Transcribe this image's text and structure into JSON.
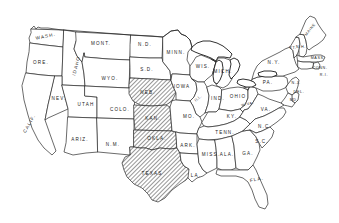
{
  "figure": {
    "type": "choropleth-outline-map",
    "title": "",
    "region": "Contiguous United States",
    "background_color": "#ffffff",
    "outline_color": "#2b2b2b",
    "shading": {
      "style": "diagonal-hatch",
      "color": "#4a4a4a",
      "description": "Diagonally hatched area covering the Southern Great Plains"
    }
  },
  "shaded_states": [
    "TEXAS",
    "OKLA.",
    "KAN.",
    "NEB."
  ],
  "states": [
    {
      "id": "wash",
      "label": "WASH.",
      "x": 46,
      "y": 37,
      "rot": "rot-slight",
      "size": "normal",
      "shaded": false
    },
    {
      "id": "ore",
      "label": "ORE.",
      "x": 41,
      "y": 63,
      "rot": "",
      "size": "normal",
      "shaded": false
    },
    {
      "id": "calif",
      "label": "CALIF.",
      "x": 30,
      "y": 124,
      "rot": "rot-calif",
      "size": "normal",
      "shaded": false
    },
    {
      "id": "idaho",
      "label": "IDAHO",
      "x": 77,
      "y": 66,
      "rot": "rot-idaho",
      "size": "normal",
      "shaded": false
    },
    {
      "id": "nev",
      "label": "NEV.",
      "x": 59,
      "y": 99,
      "rot": "",
      "size": "normal",
      "shaded": false
    },
    {
      "id": "utah",
      "label": "UTAH",
      "x": 86,
      "y": 105,
      "rot": "",
      "size": "normal",
      "shaded": false
    },
    {
      "id": "ariz",
      "label": "ARIZ.",
      "x": 80,
      "y": 140,
      "rot": "",
      "size": "normal",
      "shaded": false
    },
    {
      "id": "mont",
      "label": "MONT.",
      "x": 101,
      "y": 44,
      "rot": "",
      "size": "normal",
      "shaded": false
    },
    {
      "id": "wyo",
      "label": "WYO.",
      "x": 110,
      "y": 79,
      "rot": "",
      "size": "normal",
      "shaded": false
    },
    {
      "id": "colo",
      "label": "COLO.",
      "x": 120,
      "y": 110,
      "rot": "",
      "size": "normal",
      "shaded": false
    },
    {
      "id": "nm",
      "label": "N.M.",
      "x": 113,
      "y": 145,
      "rot": "",
      "size": "normal",
      "shaded": false
    },
    {
      "id": "nd",
      "label": "N.D.",
      "x": 145,
      "y": 45,
      "rot": "",
      "size": "normal",
      "shaded": false
    },
    {
      "id": "sd",
      "label": "S.D.",
      "x": 147,
      "y": 70,
      "rot": "",
      "size": "normal",
      "shaded": false
    },
    {
      "id": "neb",
      "label": "NEB.",
      "x": 148,
      "y": 93,
      "rot": "",
      "size": "normal",
      "shaded": true
    },
    {
      "id": "kan",
      "label": "KAN.",
      "x": 153,
      "y": 119,
      "rot": "",
      "size": "normal",
      "shaded": true
    },
    {
      "id": "okla",
      "label": "OKLA.",
      "x": 157,
      "y": 139,
      "rot": "",
      "size": "normal",
      "shaded": true
    },
    {
      "id": "texas",
      "label": "TEXAS",
      "x": 152,
      "y": 174,
      "rot": "",
      "size": "normal",
      "shaded": true
    },
    {
      "id": "minn",
      "label": "MINN.",
      "x": 176,
      "y": 53,
      "rot": "",
      "size": "normal",
      "shaded": false
    },
    {
      "id": "iowa",
      "label": "IOWA",
      "x": 182,
      "y": 87,
      "rot": "",
      "size": "normal",
      "shaded": false
    },
    {
      "id": "mo",
      "label": "MO.",
      "x": 189,
      "y": 117,
      "rot": "",
      "size": "normal",
      "shaded": false
    },
    {
      "id": "ark",
      "label": "ARK.",
      "x": 188,
      "y": 146,
      "rot": "",
      "size": "normal",
      "shaded": false
    },
    {
      "id": "la",
      "label": "LA.",
      "x": 196,
      "y": 176,
      "rot": "",
      "size": "normal",
      "shaded": false
    },
    {
      "id": "wis",
      "label": "WIS.",
      "x": 203,
      "y": 67,
      "rot": "",
      "size": "normal",
      "shaded": false
    },
    {
      "id": "ill",
      "label": "ILL.",
      "x": 199,
      "y": 99,
      "rot": "rot",
      "size": "tiny",
      "shaded": false
    },
    {
      "id": "mich",
      "label": "MICH.",
      "x": 223,
      "y": 72,
      "rot": "",
      "size": "normal",
      "shaded": false
    },
    {
      "id": "ind",
      "label": "IND.",
      "x": 218,
      "y": 99,
      "rot": "",
      "size": "normal",
      "shaded": false
    },
    {
      "id": "ohio",
      "label": "OHIO",
      "x": 238,
      "y": 97,
      "rot": "",
      "size": "normal",
      "shaded": false
    },
    {
      "id": "ky",
      "label": "KY.",
      "x": 232,
      "y": 117,
      "rot": "",
      "size": "normal",
      "shaded": false
    },
    {
      "id": "tenn",
      "label": "TENN.",
      "x": 225,
      "y": 133,
      "rot": "",
      "size": "normal",
      "shaded": false
    },
    {
      "id": "miss",
      "label": "MISS.",
      "x": 211,
      "y": 155,
      "rot": "",
      "size": "normal",
      "shaded": false
    },
    {
      "id": "ala",
      "label": "ALA.",
      "x": 227,
      "y": 155,
      "rot": "",
      "size": "normal",
      "shaded": false
    },
    {
      "id": "ga",
      "label": "GA.",
      "x": 248,
      "y": 154,
      "rot": "",
      "size": "normal",
      "shaded": false
    },
    {
      "id": "fla",
      "label": "FLA.",
      "x": 257,
      "y": 180,
      "rot": "rot-slight",
      "size": "normal",
      "shaded": false
    },
    {
      "id": "sc",
      "label": "S.C.",
      "x": 262,
      "y": 142,
      "rot": "",
      "size": "normal",
      "shaded": false
    },
    {
      "id": "nc",
      "label": "N.C.",
      "x": 265,
      "y": 127,
      "rot": "",
      "size": "normal",
      "shaded": false
    },
    {
      "id": "va",
      "label": "VA.",
      "x": 266,
      "y": 110,
      "rot": "",
      "size": "normal",
      "shaded": false
    },
    {
      "id": "wva",
      "label": "W.VA.",
      "x": 248,
      "y": 105,
      "rot": "rot-slight",
      "size": "tiny",
      "shaded": false
    },
    {
      "id": "pa",
      "label": "PA.",
      "x": 268,
      "y": 83,
      "rot": "",
      "size": "normal",
      "shaded": false
    },
    {
      "id": "ny",
      "label": "N.Y.",
      "x": 274,
      "y": 63,
      "rot": "",
      "size": "normal",
      "shaded": false
    },
    {
      "id": "vt",
      "label": "VT.",
      "x": 293,
      "y": 49,
      "rot": "",
      "size": "tiny",
      "shaded": false
    },
    {
      "id": "nh",
      "label": "N.H.",
      "x": 301,
      "y": 48,
      "rot": "",
      "size": "tiny",
      "shaded": false
    },
    {
      "id": "maine",
      "label": "MAINE",
      "x": 311,
      "y": 30,
      "rot": "rot-maine",
      "size": "tiny",
      "shaded": false
    },
    {
      "id": "mass",
      "label": "MASS.",
      "x": 318,
      "y": 59,
      "rot": "",
      "size": "tiny",
      "shaded": false
    },
    {
      "id": "conn",
      "label": "CONN.",
      "x": 320,
      "y": 69,
      "rot": "",
      "size": "tiny",
      "shaded": false
    },
    {
      "id": "ri",
      "label": "R.I.",
      "x": 324,
      "y": 76,
      "rot": "",
      "size": "tiny",
      "shaded": false
    },
    {
      "id": "nj",
      "label": "N.J.",
      "x": 296,
      "y": 84,
      "rot": "",
      "size": "tiny",
      "shaded": false
    },
    {
      "id": "del",
      "label": "DEL.",
      "x": 299,
      "y": 93,
      "rot": "",
      "size": "tiny",
      "shaded": false
    },
    {
      "id": "md",
      "label": "MD.",
      "x": 294,
      "y": 101,
      "rot": "",
      "size": "tiny",
      "shaded": false
    }
  ]
}
